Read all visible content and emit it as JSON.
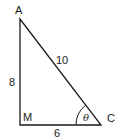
{
  "diagram": {
    "type": "right-triangle",
    "vertices": {
      "A": {
        "label": "A"
      },
      "M": {
        "label": "M"
      },
      "C": {
        "label": "C"
      }
    },
    "sides": {
      "AC": {
        "label": "10",
        "role": "hypotenuse"
      },
      "AM": {
        "label": "8",
        "role": "vertical leg"
      },
      "MC": {
        "label": "6",
        "role": "horizontal leg"
      }
    },
    "angle": {
      "vertex": "C",
      "label": "θ"
    },
    "colors": {
      "stroke": "#1a1a1a",
      "background": "#ffffff"
    }
  }
}
